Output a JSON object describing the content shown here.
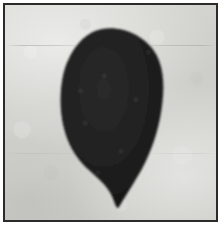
{
  "image": {
    "kind": "photograph",
    "subject_label": "dark leaf-shaped specimen silhouette",
    "orientation": "portrait",
    "color_mode": "grayscale",
    "width_px": 221,
    "height_px": 225
  },
  "frame": {
    "label": "photographic plate border",
    "border_color": "#2b2b2b",
    "border_width_px": 2,
    "outer_margin_color": "#ffffff",
    "outer_margin_px": 3
  },
  "background": {
    "label": "mottled light gray paper backdrop",
    "base_color": "#cfcfcb",
    "highlight_color": "#e2e2de",
    "shadow_color": "#b6b6b2",
    "creases": [
      {
        "name": "upper-crease",
        "y_px": 45,
        "color": "#96968f"
      },
      {
        "name": "lower-crease",
        "y_px": 153,
        "color": "#96968f"
      }
    ]
  },
  "specimen": {
    "label": "specimen silhouette",
    "shape_description": "broad rounded ovate blade, widest above center, tapering to a narrow downward-pointing tip at the base",
    "fill_color": "#1e1e1e",
    "edge_color": "#2f2f2f",
    "texture": "fine granular matte",
    "bounds_px": {
      "left": 62,
      "top": 26,
      "right": 159,
      "bottom": 204
    },
    "widest_point_y_px": 105,
    "tip_point_px": {
      "x": 118,
      "y": 203
    },
    "apex_point_px": {
      "x": 108,
      "y": 27
    }
  }
}
